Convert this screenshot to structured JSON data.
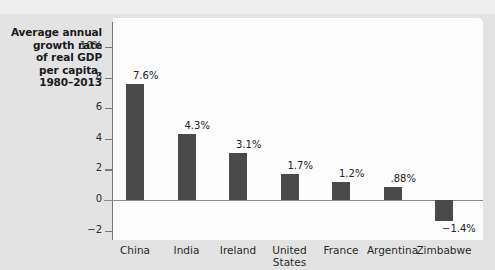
{
  "chart_data": {
    "type": "bar",
    "title": "Average annual growth rate of real GDP per capita, 1980–2013",
    "title_lines": [
      "Average annual",
      "growth rate",
      "of real GDP",
      "per capita,",
      "1980–2013"
    ],
    "xlabel": "",
    "ylabel": "",
    "ylim": [
      -3,
      11
    ],
    "grid": false,
    "legend": "none",
    "bar_color": "#4a4a4a",
    "plot_bg": "#fdfdfd",
    "figure_bg": "#e3e3e3",
    "categories": [
      "China",
      "India",
      "Ireland",
      "United States",
      "France",
      "Argentina",
      "Zimbabwe"
    ],
    "category_labels": [
      "China",
      "India",
      "Ireland",
      "United\nStates",
      "France",
      "Argentina",
      "Zimbabwe"
    ],
    "values": [
      7.6,
      4.3,
      3.1,
      1.7,
      1.2,
      0.88,
      -1.4
    ],
    "value_labels": [
      "7.6%",
      "4.3%",
      "3.1%",
      "1.7%",
      "1.2%",
      ".88%",
      "−1.4%"
    ],
    "yticks": [
      10,
      8,
      6,
      4,
      2,
      0,
      -2
    ],
    "ytick_labels": [
      "10%",
      "8",
      "6",
      "4",
      "2",
      "0",
      "−2"
    ]
  }
}
